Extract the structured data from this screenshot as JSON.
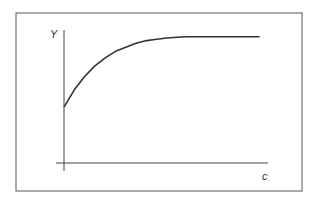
{
  "chart_data": {
    "type": "line",
    "title": "",
    "xlabel": "c",
    "ylabel": "Y",
    "grid": false,
    "legend": "none",
    "xlim": [
      0,
      1
    ],
    "ylim": [
      0,
      1
    ],
    "series": [
      {
        "name": "Y(c)",
        "description": "Concave saturating curve starting at a positive intercept and leveling off to a plateau",
        "x": [
          0,
          0.05,
          0.1,
          0.15,
          0.2,
          0.25,
          0.3,
          0.35,
          0.4,
          0.45,
          0.5,
          0.55,
          0.6,
          0.65,
          0.7,
          0.75,
          0.8,
          0.85,
          0.9,
          0.95
        ],
        "y": [
          0.42,
          0.55,
          0.65,
          0.73,
          0.79,
          0.84,
          0.87,
          0.9,
          0.92,
          0.93,
          0.94,
          0.945,
          0.95,
          0.95,
          0.95,
          0.95,
          0.95,
          0.95,
          0.95,
          0.95
        ]
      }
    ]
  },
  "colors": {
    "line": "#333333",
    "frame": "#555555",
    "background": "#ffffff"
  }
}
